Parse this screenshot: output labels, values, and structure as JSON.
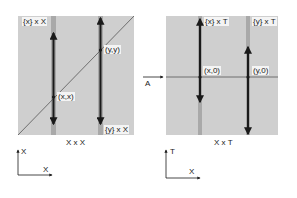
{
  "left_panel": {
    "caption": "X x X",
    "fiber_labels": {
      "top": "{x} x X",
      "bottom": "{y} x X"
    },
    "points": {
      "diagonal_lower": "(x,x)",
      "diagonal_upper": "(y,y)"
    },
    "axes": {
      "vertical": "X",
      "horizontal": "X"
    }
  },
  "right_panel": {
    "caption": "X x T",
    "fiber_labels": {
      "left": "{x} x T",
      "right": "{y} x T"
    },
    "points": {
      "left": "(x,0)",
      "right": "(y,0)"
    },
    "section_label": "A",
    "axes": {
      "vertical": "T",
      "horizontal": "X"
    }
  },
  "colors": {
    "panel_fill": "#cfcfcf",
    "fiber_band": "#a9a9a9",
    "line": "#1a1a1a"
  }
}
